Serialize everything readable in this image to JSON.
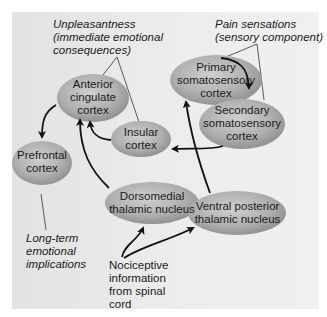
{
  "diagram": {
    "colors": {
      "panel_bg": "#e8e8e8",
      "node_fill_light": "#c4c4c4",
      "node_fill_dark": "#8e8e8e",
      "arrow": "#111111",
      "text": "#1a1a1a"
    },
    "annotations": {
      "unpleasantness": [
        "Unpleasantness",
        "(immediate emotional",
        "consequences)"
      ],
      "pain_sensations": [
        "Pain sensations",
        "(sensory component)"
      ],
      "long_term": [
        "Long-term",
        "emotional",
        "implications"
      ]
    },
    "nodes": {
      "anterior_cingulate": [
        "Anterior",
        "cingulate",
        "cortex"
      ],
      "primary_somatosensory": [
        "Primary",
        "somatosensory",
        "cortex"
      ],
      "secondary_somatosensory": [
        "Secondary",
        "somatosensory",
        "cortex"
      ],
      "insular": [
        "Insular",
        "cortex"
      ],
      "prefrontal": [
        "Prefrontal",
        "cortex"
      ],
      "dorsomedial": [
        "Dorsomedial",
        "thalamic nucleus"
      ],
      "ventral_posterior": [
        "Ventral posterior",
        "thalamic nucleus"
      ]
    },
    "source": [
      "Nociceptive",
      "information",
      "from spinal",
      "cord"
    ],
    "edges": [
      {
        "from": "Nociceptive information",
        "to": "Dorsomedial thalamic nucleus"
      },
      {
        "from": "Nociceptive information",
        "to": "Ventral posterior thalamic nucleus"
      },
      {
        "from": "Dorsomedial thalamic nucleus",
        "to": "Anterior cingulate cortex"
      },
      {
        "from": "Ventral posterior thalamic nucleus",
        "to": "Primary somatosensory cortex"
      },
      {
        "from": "Primary somatosensory cortex",
        "to": "Secondary somatosensory cortex"
      },
      {
        "from": "Secondary somatosensory cortex",
        "to": "Insular cortex"
      },
      {
        "from": "Insular cortex",
        "to": "Anterior cingulate cortex"
      },
      {
        "from": "Anterior cingulate cortex",
        "to": "Prefrontal cortex"
      }
    ]
  }
}
